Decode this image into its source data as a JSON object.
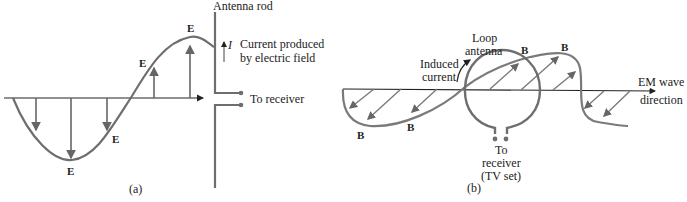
{
  "panel_a": {
    "caption": "(a)",
    "antenna_label": "Antenna rod",
    "current_symbol": "I",
    "current_label_line1": "Current produced",
    "current_label_line2": "by electric field",
    "receiver_label": "To receiver",
    "field_label": "E",
    "colors": {
      "curve": "#6e6e70",
      "axis": "#222222"
    }
  },
  "panel_b": {
    "caption": "(b)",
    "top_cutoff_label": "antenna",
    "loop_label_line1": "Loop",
    "loop_label_line2": "antenna",
    "induced_label_line1": "Induced",
    "induced_label_line2": "current",
    "wave_label_line1": "EM wave",
    "wave_label_line2": "direction",
    "receiver_line1": "To",
    "receiver_line2": "receiver",
    "receiver_line3": "(TV set)",
    "field_label": "B",
    "colors": {
      "curve": "#7a7a7c",
      "axis": "#222222"
    }
  }
}
